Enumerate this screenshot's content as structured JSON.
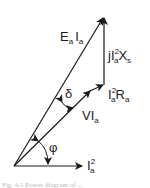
{
  "diagram": {
    "type": "phasor-power-diagram",
    "labels": {
      "ea_ia": {
        "main": "E",
        "sub1": "a",
        "main2": "I",
        "sub2": "a"
      },
      "jxs": {
        "prefix": "jI",
        "sup": "2",
        "sub": "a",
        "rest": "X",
        "sub2": "s"
      },
      "ra": {
        "main": "I",
        "sup": "2",
        "sub": "a",
        "rest": "R",
        "sub2": "a"
      },
      "vi": {
        "main": "VI",
        "sub": "a"
      },
      "ia2": {
        "main": "I",
        "sup": "2",
        "sub": "a"
      },
      "delta": "δ",
      "phi": "φ"
    },
    "caption": "Fig. 4.1 Power diagram of ..."
  },
  "colors": {
    "stroke": "#1a1a1a",
    "background": "#ffffff",
    "caption": "#b8b8b8"
  }
}
